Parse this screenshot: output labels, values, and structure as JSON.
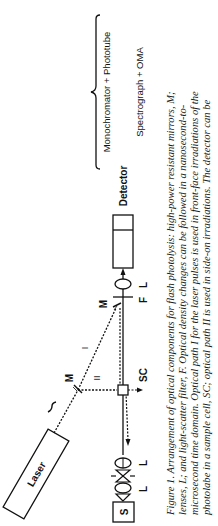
{
  "figure": {
    "labels": {
      "source": "S",
      "lens_1": "L",
      "lens_2": "L",
      "laser": "Laser",
      "mirror_1": "M",
      "mirror_2": "M",
      "path_1": "I",
      "path_2": "II",
      "sample_cell": "SC",
      "filter": "F",
      "lens_3": "L",
      "detector": "Detector",
      "detector_option_1": "Monochromator + Phototube",
      "detector_option_2": "Spectrograph + OMA"
    }
  },
  "caption": {
    "lines": [
      "Figure 1.  Arrangement of optical components for flash photolysis:  high-power resistant mirrors, M;",
      "lenses, L; and light-scatter filter, F.  Optical density changes can be followed in a nanosecond-to-",
      "microsecond time domain.  Optical path I for the laser pulses is used in front-face irradiations of the",
      "photolabe in a sample cell, SC; optical path II is used in side-on irradiations.  The detector can be"
    ]
  }
}
